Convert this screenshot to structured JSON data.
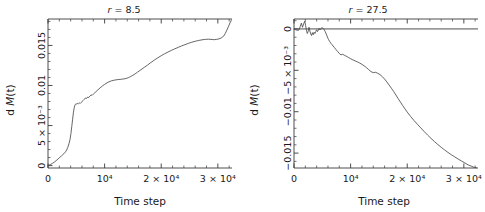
{
  "figure": {
    "background_color": "#ffffff",
    "curve_color": "#4a4a4a",
    "axis_color": "#3a3a3a"
  },
  "panels": [
    {
      "id": "panel-left",
      "title": "r = 8.5",
      "title_symbol": "r",
      "title_value": "8.5"
    },
    {
      "id": "panel-right",
      "title": "r = 27.5",
      "title_symbol": "r",
      "title_value": "27.5"
    }
  ],
  "chart_data": [
    {
      "type": "line",
      "title": "r = 8.5",
      "xlabel": "Time step",
      "ylabel": "d M(t)",
      "xlim": [
        0,
        32500
      ],
      "ylim": [
        -0.0003,
        0.0183
      ],
      "grid": false,
      "legend": null,
      "xticks": [
        0,
        10000,
        20000,
        30000
      ],
      "xticklabels": [
        "0",
        "10⁴",
        "2 × 10⁴",
        "3 × 10⁴"
      ],
      "yticks": [
        0,
        0.005,
        0.01,
        0.015
      ],
      "yticklabels": [
        "0",
        "5 × 10⁻³",
        "0.01",
        "0.015"
      ],
      "series": [
        {
          "name": "dM(t)",
          "x": [
            0,
            400,
            800,
            1200,
            1600,
            2000,
            2400,
            2800,
            3100,
            3300,
            3500,
            3700,
            3900,
            4050,
            4200,
            4350,
            4500,
            4650,
            4800,
            4950,
            5100,
            5250,
            5400,
            5550,
            5700,
            5850,
            6000,
            6200,
            6400,
            6600,
            6800,
            7000,
            7200,
            7400,
            7600,
            7800,
            8000,
            8400,
            8800,
            9200,
            9600,
            10000,
            10600,
            11200,
            11800,
            12400,
            13000,
            13400,
            13800,
            14200,
            14600,
            15000,
            15400,
            15800,
            16400,
            17000,
            17600,
            18200,
            18800,
            19400,
            20000,
            20600,
            21200,
            21800,
            22400,
            23000,
            23600,
            24200,
            24800,
            25400,
            26000,
            26600,
            27200,
            27800,
            28400,
            29000,
            29400,
            29800,
            30200,
            30600,
            31000,
            31300,
            31600,
            31900,
            32200,
            32400
          ],
          "y": [
            2e-05,
            0.00012,
            0.00028,
            0.00048,
            0.00072,
            0.00098,
            0.00122,
            0.00148,
            0.00172,
            0.00196,
            0.00228,
            0.00272,
            0.0033,
            0.004,
            0.00488,
            0.0058,
            0.00668,
            0.0073,
            0.00762,
            0.00772,
            0.00768,
            0.00778,
            0.00772,
            0.00782,
            0.00776,
            0.00788,
            0.00798,
            0.00812,
            0.00826,
            0.00844,
            0.00838,
            0.00856,
            0.0085,
            0.00868,
            0.00882,
            0.00878,
            0.00892,
            0.00918,
            0.00944,
            0.0097,
            0.00994,
            0.01014,
            0.0104,
            0.01058,
            0.01068,
            0.01074,
            0.01078,
            0.01082,
            0.01088,
            0.01098,
            0.01112,
            0.01128,
            0.01146,
            0.01166,
            0.01196,
            0.01226,
            0.01256,
            0.01288,
            0.01318,
            0.01346,
            0.01372,
            0.01396,
            0.01418,
            0.01438,
            0.01458,
            0.01476,
            0.01494,
            0.0151,
            0.01526,
            0.0154,
            0.01552,
            0.01562,
            0.0157,
            0.01576,
            0.01578,
            0.01574,
            0.01572,
            0.01576,
            0.01582,
            0.01594,
            0.01614,
            0.01648,
            0.01692,
            0.0174,
            0.0179,
            0.01818
          ]
        }
      ]
    },
    {
      "type": "line",
      "title": "r = 27.5",
      "xlabel": "Time step",
      "ylabel": "d M(t)",
      "xlim": [
        0,
        32500
      ],
      "ylim": [
        -0.0168,
        0.0012
      ],
      "grid": false,
      "legend": null,
      "zero_reference_line": 0,
      "xticks": [
        0,
        10000,
        20000,
        30000
      ],
      "xticklabels": [
        "0",
        "10⁴",
        "2 × 10⁴",
        "3 × 10⁴"
      ],
      "yticks": [
        0,
        -0.005,
        -0.01,
        -0.015
      ],
      "yticklabels": [
        "0",
        "−5 × 10⁻³",
        "−0.01",
        "−0.015"
      ],
      "series": [
        {
          "name": "dM(t)",
          "x": [
            0,
            300,
            600,
            900,
            1100,
            1300,
            1500,
            1700,
            1900,
            2050,
            2200,
            2350,
            2500,
            2650,
            2800,
            2950,
            3100,
            3250,
            3400,
            3550,
            3700,
            3850,
            4000,
            4150,
            4300,
            4450,
            4600,
            4750,
            4900,
            5100,
            5300,
            5500,
            5700,
            5900,
            6100,
            6300,
            6500,
            6700,
            6900,
            7100,
            7400,
            7700,
            8000,
            8300,
            8600,
            8900,
            9200,
            9600,
            10000,
            10400,
            10800,
            11200,
            11600,
            12000,
            12400,
            12800,
            13200,
            13600,
            14000,
            14400,
            14800,
            15200,
            15600,
            16000,
            16400,
            16800,
            17200,
            17600,
            18000,
            18400,
            18800,
            19200,
            19600,
            20000,
            20600,
            21200,
            21800,
            22400,
            23000,
            23600,
            24200,
            24800,
            25400,
            26000,
            26600,
            27200,
            27800,
            28400,
            29000,
            29600,
            30200,
            30800,
            31400,
            31800,
            32200,
            32400
          ],
          "y": [
            -2e-05,
            -0.0001,
            -0.00018,
            -0.00012,
            0.0003,
            0.0007,
            0.0002,
            0.0006,
            0.00095,
            0.0004,
            -0.00015,
            -0.00055,
            -0.0003,
            0.0002,
            -0.00025,
            -0.0006,
            -0.0008,
            -0.00045,
            -0.0007,
            -0.0004,
            -0.00055,
            -0.0003,
            -0.0001,
            -0.00032,
            -0.00015,
            8e-05,
            -0.00012,
            2e-05,
            0.00016,
            0.0001,
            -6e-05,
            -0.0003,
            -0.00062,
            -0.00098,
            -0.00128,
            -0.00152,
            -0.00172,
            -0.00188,
            -0.00206,
            -0.00222,
            -0.00248,
            -0.00272,
            -0.00296,
            -0.00314,
            -0.00306,
            -0.00318,
            -0.00328,
            -0.00344,
            -0.0036,
            -0.00374,
            -0.00386,
            -0.00398,
            -0.00412,
            -0.00428,
            -0.00446,
            -0.00468,
            -0.00492,
            -0.00516,
            -0.00528,
            -0.00524,
            -0.00536,
            -0.00552,
            -0.00576,
            -0.00606,
            -0.0064,
            -0.00678,
            -0.00716,
            -0.00756,
            -0.00798,
            -0.00842,
            -0.00884,
            -0.00926,
            -0.00966,
            -0.01004,
            -0.01058,
            -0.01106,
            -0.01152,
            -0.01196,
            -0.0124,
            -0.01282,
            -0.01322,
            -0.0136,
            -0.01396,
            -0.0143,
            -0.01462,
            -0.01492,
            -0.0152,
            -0.01546,
            -0.01572,
            -0.01596,
            -0.0162,
            -0.01644,
            -0.0166,
            -0.01672,
            -0.01676
          ]
        }
      ]
    }
  ],
  "axis_labels": {
    "x": "Time step",
    "y_prefix": "d ",
    "y_symbol": "M",
    "y_suffix": "(t)"
  }
}
